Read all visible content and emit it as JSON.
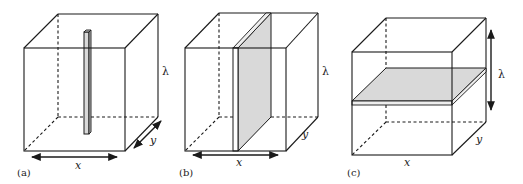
{
  "figure": {
    "colors": {
      "stroke": "#1a1a1a",
      "fill_shaded": "#d9d9d9",
      "background": "#ffffff"
    },
    "panels": [
      {
        "id": "a",
        "label": "(a)",
        "dim_x": "x",
        "dim_y": "y",
        "dim_z": "λ",
        "inset": "vertical rod"
      },
      {
        "id": "b",
        "label": "(b)",
        "dim_x": "x",
        "dim_y": "y",
        "dim_z": "λ",
        "inset": "vertical slab"
      },
      {
        "id": "c",
        "label": "(c)",
        "dim_x": "x",
        "dim_y": "y",
        "dim_z": "λ",
        "inset": "horizontal slab"
      }
    ]
  }
}
